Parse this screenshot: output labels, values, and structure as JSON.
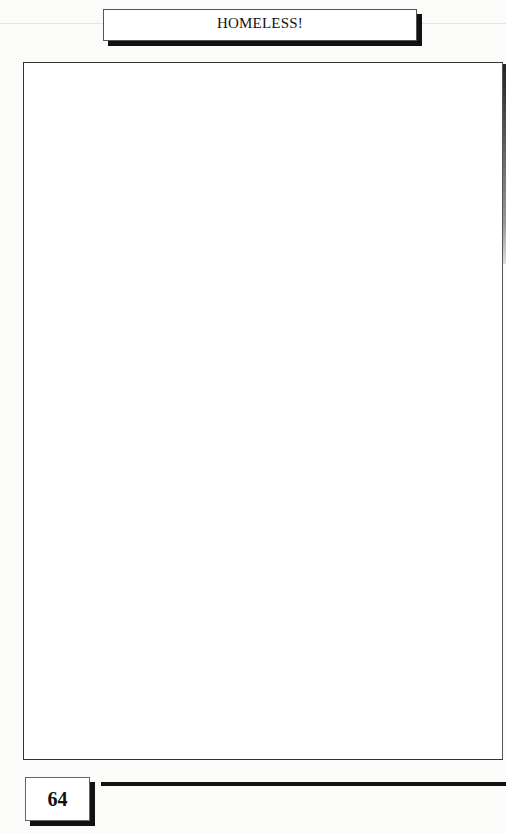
{
  "page": {
    "header": {
      "title": "HOMELESS!"
    },
    "footer": {
      "page_number": "64"
    },
    "content_frame": {
      "text": ""
    }
  }
}
